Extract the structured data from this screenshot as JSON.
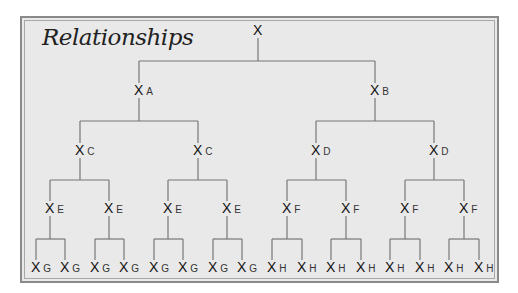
{
  "title": "Relationships",
  "colors": {
    "background": "#e9e9e9",
    "frame": "#8a8a8a",
    "lines": "#777777",
    "text": "#111111"
  },
  "nodes": [
    {
      "id": "root",
      "symbol": "X",
      "label": "",
      "x": 258,
      "y": 30
    },
    {
      "id": "a",
      "symbol": "X",
      "label": "A",
      "x": 139,
      "y": 90
    },
    {
      "id": "b",
      "symbol": "X",
      "label": "B",
      "x": 375,
      "y": 90
    },
    {
      "id": "c1",
      "symbol": "X",
      "label": "C",
      "x": 80,
      "y": 150
    },
    {
      "id": "c2",
      "symbol": "X",
      "label": "C",
      "x": 198,
      "y": 150
    },
    {
      "id": "d1",
      "symbol": "X",
      "label": "D",
      "x": 316,
      "y": 150
    },
    {
      "id": "d2",
      "symbol": "X",
      "label": "D",
      "x": 434,
      "y": 150
    },
    {
      "id": "e1",
      "symbol": "X",
      "label": "E",
      "x": 50,
      "y": 208
    },
    {
      "id": "e2",
      "symbol": "X",
      "label": "E",
      "x": 109,
      "y": 208
    },
    {
      "id": "e3",
      "symbol": "X",
      "label": "E",
      "x": 168,
      "y": 208
    },
    {
      "id": "e4",
      "symbol": "X",
      "label": "E",
      "x": 227,
      "y": 208
    },
    {
      "id": "f1",
      "symbol": "X",
      "label": "F",
      "x": 287,
      "y": 208
    },
    {
      "id": "f2",
      "symbol": "X",
      "label": "F",
      "x": 346,
      "y": 208
    },
    {
      "id": "f3",
      "symbol": "X",
      "label": "F",
      "x": 405,
      "y": 208
    },
    {
      "id": "f4",
      "symbol": "X",
      "label": "F",
      "x": 464,
      "y": 208
    },
    {
      "id": "g1",
      "symbol": "X",
      "label": "G",
      "x": 36,
      "y": 267
    },
    {
      "id": "g2",
      "symbol": "X",
      "label": "G",
      "x": 65,
      "y": 267
    },
    {
      "id": "g3",
      "symbol": "X",
      "label": "G",
      "x": 95,
      "y": 267
    },
    {
      "id": "g4",
      "symbol": "X",
      "label": "G",
      "x": 124,
      "y": 267
    },
    {
      "id": "g5",
      "symbol": "X",
      "label": "G",
      "x": 154,
      "y": 267
    },
    {
      "id": "g6",
      "symbol": "X",
      "label": "G",
      "x": 183,
      "y": 267
    },
    {
      "id": "g7",
      "symbol": "X",
      "label": "G",
      "x": 213,
      "y": 267
    },
    {
      "id": "g8",
      "symbol": "X",
      "label": "G",
      "x": 242,
      "y": 267
    },
    {
      "id": "h1",
      "symbol": "X",
      "label": "H",
      "x": 272,
      "y": 267
    },
    {
      "id": "h2",
      "symbol": "X",
      "label": "H",
      "x": 302,
      "y": 267
    },
    {
      "id": "h3",
      "symbol": "X",
      "label": "H",
      "x": 331,
      "y": 267
    },
    {
      "id": "h4",
      "symbol": "X",
      "label": "H",
      "x": 361,
      "y": 267
    },
    {
      "id": "h5",
      "symbol": "X",
      "label": "H",
      "x": 390,
      "y": 267
    },
    {
      "id": "h6",
      "symbol": "X",
      "label": "H",
      "x": 420,
      "y": 267
    },
    {
      "id": "h7",
      "symbol": "X",
      "label": "H",
      "x": 449,
      "y": 267
    },
    {
      "id": "h8",
      "symbol": "X",
      "label": "H",
      "x": 479,
      "y": 267
    }
  ],
  "edges": [
    [
      "root",
      "a"
    ],
    [
      "root",
      "b"
    ],
    [
      "a",
      "c1"
    ],
    [
      "a",
      "c2"
    ],
    [
      "b",
      "d1"
    ],
    [
      "b",
      "d2"
    ],
    [
      "c1",
      "e1"
    ],
    [
      "c1",
      "e2"
    ],
    [
      "c2",
      "e3"
    ],
    [
      "c2",
      "e4"
    ],
    [
      "d1",
      "f1"
    ],
    [
      "d1",
      "f2"
    ],
    [
      "d2",
      "f3"
    ],
    [
      "d2",
      "f4"
    ],
    [
      "e1",
      "g1"
    ],
    [
      "e1",
      "g2"
    ],
    [
      "e2",
      "g3"
    ],
    [
      "e2",
      "g4"
    ],
    [
      "e3",
      "g5"
    ],
    [
      "e3",
      "g6"
    ],
    [
      "e4",
      "g7"
    ],
    [
      "e4",
      "g8"
    ],
    [
      "f1",
      "h1"
    ],
    [
      "f1",
      "h2"
    ],
    [
      "f2",
      "h3"
    ],
    [
      "f2",
      "h4"
    ],
    [
      "f3",
      "h5"
    ],
    [
      "f3",
      "h6"
    ],
    [
      "f4",
      "h7"
    ],
    [
      "f4",
      "h8"
    ]
  ]
}
